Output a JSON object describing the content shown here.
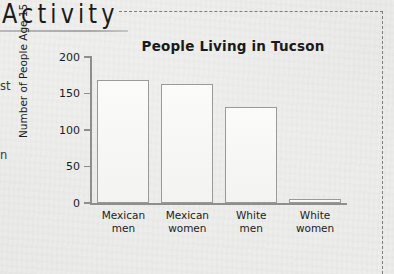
{
  "section": {
    "heading": "Activity"
  },
  "margin_fragments": {
    "line1": "st",
    "line2": "n"
  },
  "chart_data": {
    "type": "bar",
    "title": "People Living in Tucson",
    "xlabel": "",
    "ylabel": "Number of People Age 15 — 39",
    "ylim": [
      0,
      200
    ],
    "yticks": [
      0,
      50,
      100,
      150,
      200
    ],
    "ytick_labels": [
      "0",
      "50",
      "100",
      "150",
      "200"
    ],
    "grid": false,
    "legend": "none",
    "categories": [
      "Mexican men",
      "Mexican women",
      "White men",
      "White women"
    ],
    "category_lines": [
      [
        "Mexican",
        "men"
      ],
      [
        "Mexican",
        "women"
      ],
      [
        "White",
        "men"
      ],
      [
        "White",
        "women"
      ]
    ],
    "values": [
      168,
      163,
      132,
      5
    ],
    "bar_fill": "#f7f7f6",
    "bar_edge": "#9a9a9a",
    "axis_color": "#8e8e8e"
  },
  "frame": {
    "border_style": "dashed",
    "border_color": "#7d7d7d"
  }
}
